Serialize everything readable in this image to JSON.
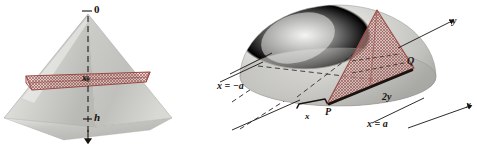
{
  "figure": {
    "background_color": "#ffffff",
    "ink_color": "#18140f",
    "cross_section_stroke": "#9c4b46",
    "cross_section_fill": "#a8625e",
    "solid_light": "#e2e2e0",
    "solid_mid": "#c9c9c6",
    "solid_dark": "#a9a9a6"
  },
  "left_figure": {
    "name": "pyramid-with-horizontal-cross-section",
    "shape": "square-pyramid",
    "axis": {
      "name": "vertical-dashed-axis",
      "direction": "downward",
      "arrowhead": true
    },
    "labels": {
      "apex": "0",
      "depth": "h",
      "cross_section": "x"
    }
  },
  "right_figure": {
    "name": "hemisphere-with-triangular-cross-section",
    "shape": "hemisphere",
    "labels": {
      "y_axis": "y",
      "x_axis": "x",
      "left_plane": "x = −a",
      "right_plane": "x = a",
      "chord": "2y",
      "offset": "x",
      "point_p": "P",
      "point_q": "Q"
    }
  }
}
